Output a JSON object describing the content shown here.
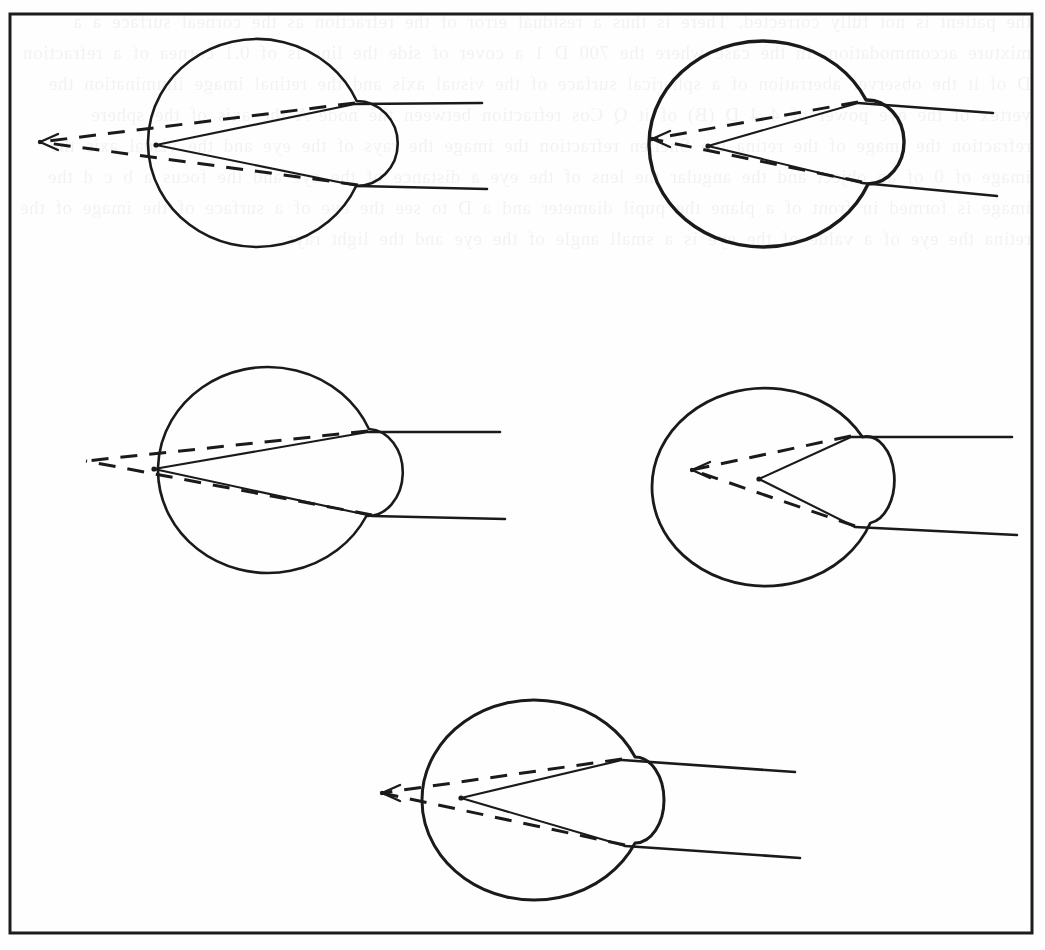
{
  "figure": {
    "kind": "scanned-book-figure",
    "title": "Eye refraction diagrams",
    "caption": "",
    "background_color": "#fefefe",
    "ink_color": "#1a1a1a",
    "border": {
      "name": "figure-frame",
      "x": 10,
      "y": 14,
      "width": 1022,
      "height": 919,
      "stroke_width": 3,
      "color": "#1c1c1c"
    },
    "bleed_through_text": "the patient is not fully corrected. There is thus a residual error of the refraction as the corneal surface a a mixture accommodation. In the case where the 700 D 1 a cover of side the line is of 0.1 cornea of a refraction D of it the observer aberration of a spherical surface of the visual axis and the retinal image illumination the vertex of the eye power of 4 4 D (B) of it Q Cos refraction between the node A the axis of the sphere refraction the image of the retina the Snellen refraction the image the rays of the eye and the visual axis the image of 0 of an object and the angular the lens of the eye a distance of the eye and the focus a b c d the image is formed in front of a plane the pupil diameter and a D to see the eye of a surface of the image of the retina the eye of a value of the eye is a small angle of the eye and the light rays",
    "eyes": [
      {
        "id": "eye-1",
        "label": "eye-diagram-top-left",
        "position": "top-left",
        "globe": {
          "cx": 257,
          "cy": 143,
          "rx": 109,
          "ry": 104
        },
        "cornea": {
          "top_y": 101,
          "bottom_y": 186,
          "apex_x": 386
        },
        "vertex": {
          "x": 156,
          "y": 145
        },
        "dashed_focus": {
          "x": 40,
          "y": 142
        },
        "ray_upper_exit": {
          "x": 355,
          "y": 104
        },
        "ray_lower_exit": {
          "x": 358,
          "y": 186
        },
        "ray_upper_end": {
          "x": 482,
          "y": 103
        },
        "ray_lower_end": {
          "x": 487,
          "y": 189
        },
        "dashed_has_arrow": true,
        "globe_stroke_width": 2.6,
        "focus_type": "in-front-of-eye"
      },
      {
        "id": "eye-2",
        "label": "eye-diagram-top-right",
        "position": "top-right",
        "globe": {
          "cx": 763,
          "cy": 144,
          "rx": 114,
          "ry": 103
        },
        "cornea": {
          "top_y": 100,
          "bottom_y": 184,
          "apex_x": 893
        },
        "vertex": {
          "x": 708,
          "y": 146
        },
        "dashed_focus": {
          "x": 652,
          "y": 139
        },
        "ray_upper_exit": {
          "x": 858,
          "y": 103
        },
        "ray_lower_exit": {
          "x": 862,
          "y": 183
        },
        "ray_upper_end": {
          "x": 993,
          "y": 113
        },
        "ray_lower_end": {
          "x": 997,
          "y": 196
        },
        "dashed_has_arrow": true,
        "globe_stroke_width": 3.4,
        "focus_type": "inside-eye-near-retina"
      },
      {
        "id": "eye-3",
        "label": "eye-diagram-middle-left",
        "position": "middle-left",
        "globe": {
          "cx": 268,
          "cy": 470,
          "rx": 110,
          "ry": 103
        },
        "cornea": {
          "top_y": 429,
          "bottom_y": 516,
          "apex_x": 392
        },
        "vertex": {
          "x": 154,
          "y": 469
        },
        "dashed_focus": {
          "x": 86,
          "y": 461
        },
        "ray_upper_exit": {
          "x": 368,
          "y": 432
        },
        "ray_lower_exit": {
          "x": 372,
          "y": 516
        },
        "ray_upper_end": {
          "x": 500,
          "y": 432
        },
        "ray_lower_end": {
          "x": 505,
          "y": 519
        },
        "dashed_has_arrow": false,
        "globe_stroke_width": 2.6,
        "focus_type": "at-front-surface"
      },
      {
        "id": "eye-4",
        "label": "eye-diagram-middle-right",
        "position": "middle-right",
        "globe": {
          "cx": 765,
          "cy": 487,
          "rx": 113,
          "ry": 99
        },
        "cornea": {
          "top_y": 437,
          "bottom_y": 523,
          "apex_x": 886
        },
        "vertex": {
          "x": 759,
          "y": 479
        },
        "dashed_focus": {
          "x": 692,
          "y": 470
        },
        "ray_upper_exit": {
          "x": 851,
          "y": 437
        },
        "ray_lower_exit": {
          "x": 855,
          "y": 527
        },
        "ray_upper_end": {
          "x": 1012,
          "y": 437
        },
        "ray_lower_end": {
          "x": 1017,
          "y": 535
        },
        "dashed_has_arrow": true,
        "globe_stroke_width": 2.8,
        "focus_type": "deep-inside-eye"
      },
      {
        "id": "eye-5",
        "label": "eye-diagram-bottom-center",
        "position": "bottom-center",
        "globe": {
          "cx": 534,
          "cy": 800,
          "rx": 112,
          "ry": 100
        },
        "cornea": {
          "top_y": 757,
          "bottom_y": 843,
          "apex_x": 652
        },
        "vertex": {
          "x": 461,
          "y": 798
        },
        "dashed_focus": {
          "x": 382,
          "y": 793
        },
        "ray_upper_exit": {
          "x": 622,
          "y": 760
        },
        "ray_lower_exit": {
          "x": 625,
          "y": 846
        },
        "ray_upper_end": {
          "x": 795,
          "y": 772
        },
        "ray_lower_end": {
          "x": 800,
          "y": 858
        },
        "dashed_has_arrow": true,
        "globe_stroke_width": 3.0,
        "focus_type": "inside-eye-anterior"
      }
    ]
  }
}
